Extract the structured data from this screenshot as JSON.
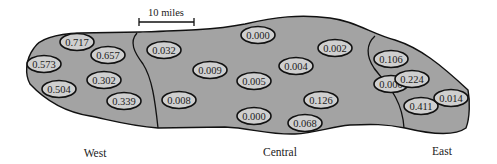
{
  "scale_bar": {
    "label": "10 miles"
  },
  "regions": [
    {
      "name": "West",
      "values": [
        {
          "label": "0.717",
          "x": 77,
          "y": 42
        },
        {
          "label": "0.657",
          "x": 108,
          "y": 55
        },
        {
          "label": "0.573",
          "x": 44,
          "y": 64
        },
        {
          "label": "0.302",
          "x": 104,
          "y": 80
        },
        {
          "label": "0.504",
          "x": 59,
          "y": 89
        },
        {
          "label": "0.339",
          "x": 124,
          "y": 101
        }
      ]
    },
    {
      "name": "Central",
      "values": [
        {
          "label": "0.032",
          "x": 164,
          "y": 50
        },
        {
          "label": "0.009",
          "x": 210,
          "y": 70
        },
        {
          "label": "0.008",
          "x": 179,
          "y": 100
        },
        {
          "label": "0.000",
          "x": 258,
          "y": 35
        },
        {
          "label": "0.002",
          "x": 335,
          "y": 48
        },
        {
          "label": "0.004",
          "x": 296,
          "y": 66
        },
        {
          "label": "0.005",
          "x": 254,
          "y": 81
        },
        {
          "label": "0.000",
          "x": 391,
          "y": 84
        },
        {
          "label": "0.126",
          "x": 321,
          "y": 100
        },
        {
          "label": "0.000",
          "x": 254,
          "y": 116
        },
        {
          "label": "0.068",
          "x": 305,
          "y": 123
        }
      ]
    },
    {
      "name": "East",
      "values": [
        {
          "label": "0.106",
          "x": 391,
          "y": 59
        },
        {
          "label": "0.224",
          "x": 412,
          "y": 79
        },
        {
          "label": "0.411",
          "x": 421,
          "y": 106
        },
        {
          "label": "0.014",
          "x": 451,
          "y": 98
        }
      ]
    }
  ],
  "region_labels": [
    {
      "name": "West",
      "x": 95,
      "y": 157
    },
    {
      "name": "Central",
      "x": 280,
      "y": 156
    },
    {
      "name": "East",
      "x": 442,
      "y": 155
    }
  ]
}
